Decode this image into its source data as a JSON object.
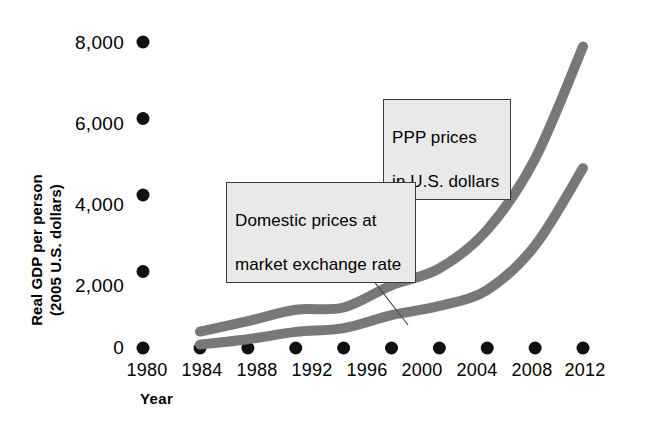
{
  "chart_data": {
    "type": "line",
    "title": "",
    "xlabel": "Year",
    "ylabel": "Real GDP per person\n(2005 U.S. dollars)",
    "ylabel_line1": "Real GDP per person",
    "ylabel_line2": "(2005 U.S. dollars)",
    "x": [
      1980,
      1984,
      1988,
      1992,
      1996,
      2000,
      2004,
      2008,
      2012
    ],
    "xtick_labels": [
      "1980",
      "1984",
      "1988",
      "1992",
      "1996",
      "2000",
      "2004",
      "2008",
      "2012"
    ],
    "ytick_labels": [
      "0",
      "2,000",
      "4,000",
      "6,000",
      "8,000"
    ],
    "ytick_values": [
      0,
      2000,
      4000,
      6000,
      8000
    ],
    "ylim": [
      0,
      8000
    ],
    "xlim": [
      1980,
      2012
    ],
    "grid": false,
    "legend_position": "annotations-inline",
    "series": [
      {
        "name": "PPP prices in U.S. dollars",
        "color": "#787878",
        "values": [
          430,
          700,
          1000,
          1060,
          1640,
          2080,
          3090,
          4950,
          7880
        ]
      },
      {
        "name": "Domestic prices at market exchange rate",
        "color": "#787878",
        "values": [
          90,
          230,
          420,
          520,
          860,
          1100,
          1520,
          2680,
          4700
        ]
      }
    ],
    "annotations": [
      {
        "id": "ppp",
        "text": "PPP prices\nin U.S. dollars",
        "line1": "PPP prices",
        "line2": "in U.S. dollars",
        "target_year": 2006,
        "target_value": 3600
      },
      {
        "id": "domestic",
        "text": "Domestic prices at\nmarket exchange rate",
        "line1": "Domestic prices at",
        "line2": "market exchange rate",
        "target_year": 2000,
        "target_value": 1100
      }
    ]
  },
  "colors": {
    "curve": "#787878",
    "annotation_fill": "#e9e9e9",
    "annotation_border": "#3a3a3a",
    "axis_dot": "#111111",
    "leader_line": "#4a4a4a"
  }
}
